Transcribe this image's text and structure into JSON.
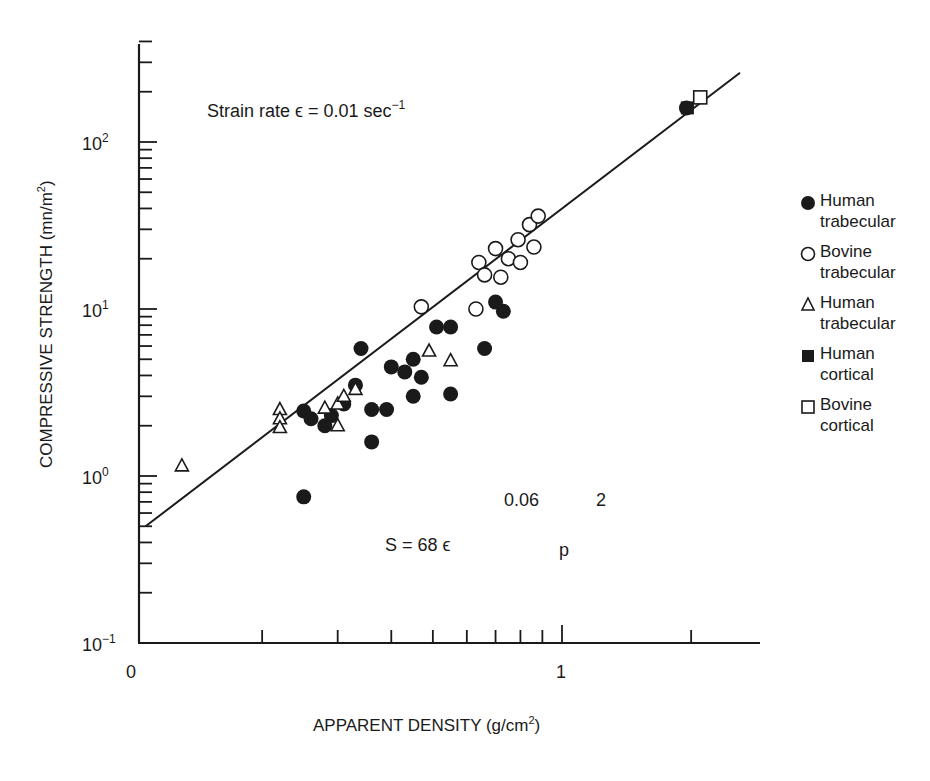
{
  "chart_data": {
    "type": "scatter",
    "title": "",
    "xlabel": "APPARENT DENSITY (g/cm2)",
    "ylabel": "COMPRESSIVE STRENGTH (mn/m2)",
    "xscale": "log",
    "yscale": "log",
    "xlim": [
      0.1,
      2.8
    ],
    "ylim": [
      0.1,
      400
    ],
    "x_tick_labels": [
      "0",
      "1"
    ],
    "x_ticks": [
      0.1,
      0.2,
      0.3,
      0.4,
      0.5,
      0.6,
      0.7,
      0.8,
      0.9,
      1,
      2
    ],
    "y_tick_labels": [
      "10^2",
      "10^1",
      "10^0",
      "10^-1"
    ],
    "y_ticks": [
      100,
      10,
      1,
      0.1
    ],
    "grid": false,
    "legend_position": "right",
    "annotations": [
      {
        "text": "Strain rate ϵ = 0.01 sec−1",
        "x": 0.19,
        "y": 160
      },
      {
        "text": "S = 68 ϵ",
        "x": 0.4,
        "y": 0.28
      },
      {
        "text": "0.06",
        "x": 0.82,
        "y": 0.55
      },
      {
        "text": "2",
        "x": 1.3,
        "y": 0.55
      },
      {
        "text": "p",
        "x": 1.0,
        "y": 0.28
      }
    ],
    "fit_line": {
      "label": "S = 68 ϵ^0.06 p^2",
      "from": [
        0.107,
        0.5
      ],
      "to": [
        2.6,
        260
      ]
    },
    "series": [
      {
        "name": "Human trabecular",
        "marker": "filled-circle",
        "points": [
          [
            0.25,
            0.75
          ],
          [
            0.25,
            2.45
          ],
          [
            0.26,
            2.2
          ],
          [
            0.28,
            2.0
          ],
          [
            0.29,
            2.3
          ],
          [
            0.31,
            2.7
          ],
          [
            0.33,
            3.5
          ],
          [
            0.34,
            5.8
          ],
          [
            0.36,
            2.5
          ],
          [
            0.36,
            1.6
          ],
          [
            0.39,
            2.5
          ],
          [
            0.4,
            4.5
          ],
          [
            0.43,
            4.2
          ],
          [
            0.45,
            5.0
          ],
          [
            0.45,
            3.0
          ],
          [
            0.47,
            3.9
          ],
          [
            0.51,
            7.8
          ],
          [
            0.55,
            7.8
          ],
          [
            0.55,
            3.1
          ],
          [
            0.66,
            5.8
          ],
          [
            0.7,
            11.0
          ],
          [
            0.73,
            9.7
          ],
          [
            1.95,
            160
          ]
        ]
      },
      {
        "name": "Bovine trabecular",
        "marker": "open-circle",
        "points": [
          [
            0.47,
            10.3
          ],
          [
            0.63,
            10.0
          ],
          [
            0.64,
            19.0
          ],
          [
            0.66,
            16.0
          ],
          [
            0.7,
            23.0
          ],
          [
            0.72,
            15.5
          ],
          [
            0.75,
            20.0
          ],
          [
            0.79,
            26.0
          ],
          [
            0.8,
            19.0
          ],
          [
            0.84,
            32.0
          ],
          [
            0.86,
            23.5
          ],
          [
            0.88,
            36.0
          ]
        ]
      },
      {
        "name": "Human trabecular",
        "marker": "open-triangle",
        "points": [
          [
            0.13,
            1.15
          ],
          [
            0.22,
            2.5
          ],
          [
            0.22,
            2.2
          ],
          [
            0.22,
            1.95
          ],
          [
            0.28,
            2.55
          ],
          [
            0.3,
            2.0
          ],
          [
            0.3,
            2.7
          ],
          [
            0.31,
            3.0
          ],
          [
            0.33,
            3.3
          ],
          [
            0.49,
            5.6
          ],
          [
            0.55,
            4.9
          ]
        ]
      },
      {
        "name": "Human cortical",
        "marker": "filled-square",
        "points": [
          [
            1.96,
            160
          ]
        ]
      },
      {
        "name": "Bovine cortical",
        "marker": "open-square",
        "points": [
          [
            2.1,
            185
          ]
        ]
      }
    ]
  },
  "axis": {
    "y_label": "COMPRESSIVE STRENGTH (mn/m",
    "y_label_sup": "2",
    "y_label_close": ")",
    "x_label": "APPARENT DENSITY (g/cm",
    "x_label_sup": "2",
    "x_label_close": ")",
    "x_zero": "0",
    "x_one": "1",
    "y_ticks": [
      {
        "base": "10",
        "exp": "2"
      },
      {
        "base": "10",
        "exp": "1"
      },
      {
        "base": "10",
        "exp": "0"
      },
      {
        "base": "10",
        "exp": "−1"
      }
    ]
  },
  "annotation": {
    "strain_prefix": "Strain rate ϵ = 0.01 sec",
    "strain_exp": "−1",
    "formula_main": "S = 68 ϵ",
    "formula_exp1": "0.06",
    "formula_exp2": "2",
    "formula_p": "p"
  },
  "legend": [
    {
      "symbol": "filled-circle",
      "line1": "Human",
      "line2": "trabecular"
    },
    {
      "symbol": "open-circle",
      "line1": "Bovine",
      "line2": "trabecular"
    },
    {
      "symbol": "open-triangle",
      "line1": "Human",
      "line2": "trabecular"
    },
    {
      "symbol": "filled-square",
      "line1": "Human",
      "line2": "cortical"
    },
    {
      "symbol": "open-square",
      "line1": "Bovine",
      "line2": "cortical"
    }
  ]
}
